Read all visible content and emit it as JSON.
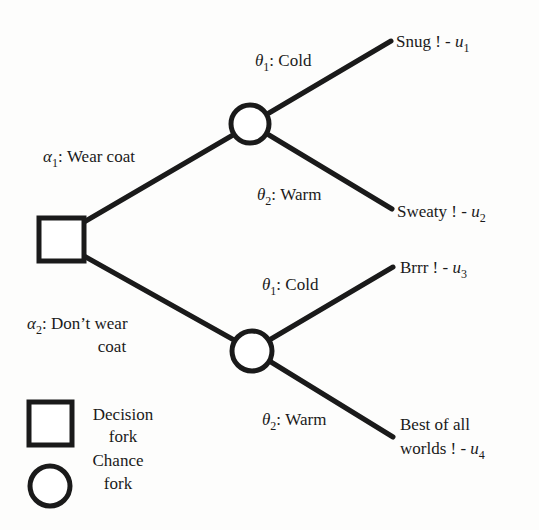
{
  "diagram": {
    "type": "decision-tree",
    "colors": {
      "stroke": "#1a1a1a",
      "background": "#fdfdfc",
      "node_fill": "#ffffff"
    },
    "root": {
      "shape": "square",
      "kind": "decision"
    },
    "actions": [
      {
        "symbol": "α",
        "subscript": "1",
        "label": ": Wear coat",
        "label_line2": "",
        "chance_node": {
          "outcomes": [
            {
              "symbol": "θ",
              "subscript": "1",
              "label": ": Cold",
              "result_text": "Snug ! - ",
              "result_text_line1": "",
              "utility_symbol": "u",
              "utility_subscript": "1"
            },
            {
              "symbol": "θ",
              "subscript": "2",
              "label": ": Warm",
              "result_text": "Sweaty ! - ",
              "result_text_line1": "",
              "utility_symbol": "u",
              "utility_subscript": "2"
            }
          ]
        }
      },
      {
        "symbol": "α",
        "subscript": "2",
        "label": ": Don’t wear",
        "label_line2": "coat",
        "chance_node": {
          "outcomes": [
            {
              "symbol": "θ",
              "subscript": "1",
              "label": ": Cold",
              "result_text": "Brrr ! - ",
              "result_text_line1": "",
              "utility_symbol": "u",
              "utility_subscript": "3"
            },
            {
              "symbol": "θ",
              "subscript": "2",
              "label": ": Warm",
              "result_text": "worlds ! - ",
              "result_text_line1": "Best of all",
              "utility_symbol": "u",
              "utility_subscript": "4"
            }
          ]
        }
      }
    ]
  },
  "legend": {
    "items": [
      {
        "shape": "square",
        "line1": "Decision",
        "line2": "fork"
      },
      {
        "shape": "circle",
        "line1": "Chance",
        "line2": "fork"
      }
    ]
  }
}
